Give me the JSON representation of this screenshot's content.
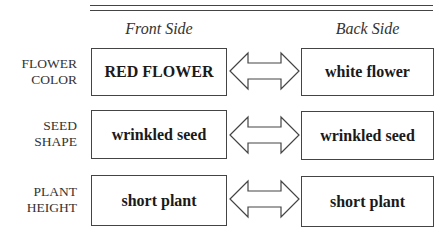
{
  "columns": {
    "front": "Front Side",
    "back": "Back Side"
  },
  "rows": [
    {
      "label_line1": "FLOWER",
      "label_line2": "COLOR",
      "front": "RED FLOWER",
      "back": "white flower"
    },
    {
      "label_line1": "SEED",
      "label_line2": "SHAPE",
      "front": "wrinkled seed",
      "back": "wrinkled seed"
    },
    {
      "label_line1": "PLANT",
      "label_line2": "HEIGHT",
      "front": "short plant",
      "back": "short plant"
    }
  ],
  "icons": {
    "connector": "double-headed-arrow-icon"
  }
}
